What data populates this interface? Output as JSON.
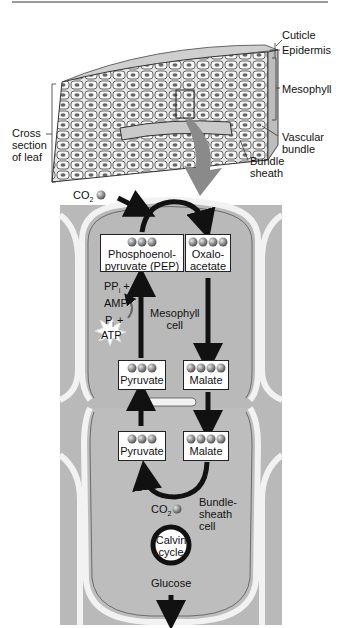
{
  "leaf": {
    "labels": {
      "cuticle": "Cuticle",
      "epidermis": "Epidermis",
      "mesophyll": "Mesophyll",
      "vascular_bundle_1": "Vascular",
      "vascular_bundle_2": "bundle",
      "bundle_sheath_1": "Bundle",
      "bundle_sheath_2": "sheath",
      "cross_section_1": "Cross",
      "cross_section_2": "section",
      "cross_section_3": "of leaf"
    }
  },
  "pathway": {
    "co2_in": "CO",
    "co2_sub": "2",
    "pep_1": "Phosphoenol-",
    "pep_2": "pyruvate (PEP)",
    "oaa_1": "Oxalo-",
    "oaa_2": "acetate",
    "ppi": "PP",
    "ppi_sub": "i",
    "ppi_plus": " +",
    "amp": "AMP",
    "pi": "P",
    "pi_sub": "i",
    "pi_plus": " +",
    "atp": "ATP",
    "mesophyll_cell_1": "Mesophyll",
    "mesophyll_cell_2": "cell",
    "pyruvate_top": "Pyruvate",
    "malate_top": "Malate",
    "pyruvate_bottom": "Pyruvate",
    "malate_bottom": "Malate",
    "co2_released": "CO",
    "co2_released_sub": "2",
    "bundle_sheath_cell_1": "Bundle-",
    "bundle_sheath_cell_2": "sheath",
    "bundle_sheath_cell_3": "cell",
    "calvin_1": "Calvin",
    "calvin_2": "cycle",
    "glucose": "Glucose"
  },
  "colors": {
    "cell_fill": "#b9b9b9",
    "wall": "#f2f2f2",
    "wall_edge": "#555555",
    "arrow": "#111111",
    "dot": "#8a8a8a"
  }
}
